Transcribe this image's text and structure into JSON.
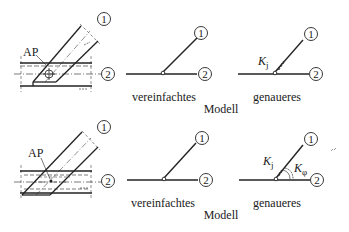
{
  "diagram": {
    "rows": [
      {
        "id": "top",
        "detail": {
          "label_ap": "AP",
          "member_1": "1",
          "member_2": "2",
          "joint_marker": "crosshair"
        },
        "simplified": {
          "caption": "vereinfachtes",
          "member_1": "1",
          "member_2": "2"
        },
        "refined": {
          "caption": "genaueres",
          "member_1": "1",
          "member_2": "2",
          "spring_j": "K",
          "spring_j_sub": "j"
        },
        "model_label": "Modell"
      },
      {
        "id": "bottom",
        "detail": {
          "label_ap": "AP",
          "member_1": "1",
          "member_2": "2",
          "joint_marker": "dot"
        },
        "simplified": {
          "caption": "vereinfachtes",
          "member_1": "1",
          "member_2": "2"
        },
        "refined": {
          "caption": "genaueres",
          "member_1": "1",
          "member_2": "2",
          "spring_j": "K",
          "spring_j_sub": "j",
          "spring_phi": "K",
          "spring_phi_sub": "φ"
        },
        "model_label": "Modell"
      }
    ]
  }
}
